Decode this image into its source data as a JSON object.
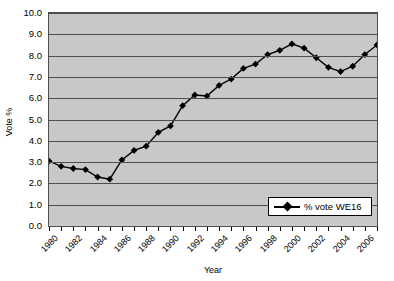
{
  "chart_data": {
    "type": "line",
    "title": "",
    "xlabel": "Year",
    "ylabel": "Vote %",
    "ylim": [
      0.0,
      10.0
    ],
    "ytick_step": 1.0,
    "ytick_labels": [
      "10.0",
      "9.0",
      "8.0",
      "7.0",
      "6.0",
      "5.0",
      "4.0",
      "3.0",
      "2.0",
      "1.0",
      "0.0"
    ],
    "xlim": [
      1980,
      2007
    ],
    "xtick_labels": [
      "1980",
      "1982",
      "1984",
      "1986",
      "1988",
      "1990",
      "1992",
      "1994",
      "1996",
      "1998",
      "2000",
      "2002",
      "2004",
      "2006"
    ],
    "xtick_years": [
      1980,
      1982,
      1984,
      1986,
      1988,
      1990,
      1992,
      1994,
      1996,
      1998,
      2000,
      2002,
      2004,
      2006
    ],
    "grid": "horizontal",
    "legend_position": "bottom-right",
    "marker": "diamond",
    "series": [
      {
        "name": "% vote WE16",
        "x": [
          1980,
          1981,
          1982,
          1983,
          1984,
          1985,
          1986,
          1987,
          1988,
          1989,
          1990,
          1991,
          1992,
          1993,
          1994,
          1995,
          1996,
          1997,
          1998,
          1999,
          2000,
          2001,
          2002,
          2003,
          2004,
          2005,
          2006,
          2007
        ],
        "values": [
          3.05,
          2.8,
          2.7,
          2.65,
          2.3,
          2.2,
          3.1,
          3.55,
          3.75,
          4.4,
          4.7,
          5.65,
          6.15,
          6.1,
          6.6,
          6.9,
          7.4,
          7.6,
          8.05,
          8.25,
          8.55,
          8.35,
          7.9,
          7.45,
          7.25,
          7.5,
          8.05,
          8.5
        ]
      }
    ],
    "colors": {
      "plot_background": "#c8c8c8",
      "page_background": "#ffffff",
      "gridline": "#4d4d4d",
      "axis": "#4d4d4d",
      "series_line": "#000000",
      "marker_fill": "#000000",
      "legend_background": "#ffffff",
      "text": "#000000"
    }
  },
  "legend": {
    "entries": [
      {
        "label": "% vote WE16"
      }
    ]
  }
}
